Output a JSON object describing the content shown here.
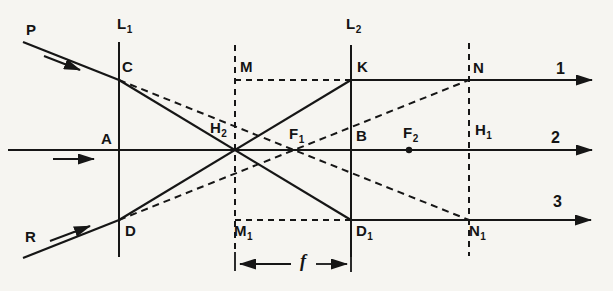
{
  "figure": {
    "ink_color": "#161616",
    "paper_color": "#f6f5f1"
  },
  "labels": {
    "P": {
      "base": "P",
      "sub": ""
    },
    "L1": {
      "base": "L",
      "sub": "1"
    },
    "C": {
      "base": "C",
      "sub": ""
    },
    "A": {
      "base": "A",
      "sub": ""
    },
    "D": {
      "base": "D",
      "sub": ""
    },
    "R": {
      "base": "R",
      "sub": ""
    },
    "M": {
      "base": "M",
      "sub": ""
    },
    "H2": {
      "base": "H",
      "sub": "2"
    },
    "M1": {
      "base": "M",
      "sub": "1"
    },
    "F1": {
      "base": "F",
      "sub": "1"
    },
    "L2": {
      "base": "L",
      "sub": "2"
    },
    "K": {
      "base": "K",
      "sub": ""
    },
    "B": {
      "base": "B",
      "sub": ""
    },
    "D1": {
      "base": "D",
      "sub": "1"
    },
    "F2": {
      "base": "F",
      "sub": "2"
    },
    "N": {
      "base": "N",
      "sub": ""
    },
    "H1": {
      "base": "H",
      "sub": "1"
    },
    "N1": {
      "base": "N",
      "sub": "1"
    },
    "ray1": {
      "base": "1",
      "sub": ""
    },
    "ray2": {
      "base": "2",
      "sub": ""
    },
    "ray3": {
      "base": "3",
      "sub": ""
    },
    "focal_length": {
      "base": "f",
      "sub": ""
    }
  }
}
